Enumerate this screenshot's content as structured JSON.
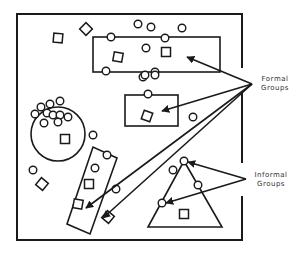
{
  "labels": {
    "formal": [
      "Formal",
      "Groups"
    ],
    "informal": [
      "Informal",
      "Groups"
    ]
  },
  "colors": {
    "stroke": "#1a1a1a",
    "background": "#ffffff",
    "label": "#333333"
  },
  "frame": {
    "x1": 17,
    "y1": 14,
    "x2": 242,
    "y2": 240,
    "right_gaps": [
      [
        68,
        92
      ],
      [
        163,
        196
      ]
    ]
  },
  "formal_groups": [
    {
      "shape": "rect",
      "x": 93,
      "y": 37,
      "w": 127,
      "h": 35
    },
    {
      "shape": "rect",
      "x": 125,
      "y": 95,
      "w": 53,
      "h": 31
    },
    {
      "shape": "rotated-rect",
      "points": [
        [
          67,
          224
        ],
        [
          93,
          147
        ],
        [
          117,
          158
        ],
        [
          90,
          234
        ]
      ]
    }
  ],
  "informal_groups": [
    {
      "shape": "circle",
      "cx": 58,
      "cy": 134,
      "r": 27
    },
    {
      "shape": "triangle",
      "points": [
        [
          184,
          161
        ],
        [
          148,
          227
        ],
        [
          222,
          227
        ]
      ]
    }
  ],
  "people_circles": [
    [
      138,
      24
    ],
    [
      151,
      27
    ],
    [
      182,
      28
    ],
    [
      111,
      37
    ],
    [
      165,
      38
    ],
    [
      146,
      48
    ],
    [
      106,
      71
    ],
    [
      143,
      77
    ],
    [
      155,
      72
    ],
    [
      155,
      75
    ],
    [
      145,
      75
    ],
    [
      148,
      94
    ],
    [
      60,
      101
    ],
    [
      50,
      104
    ],
    [
      41,
      107
    ],
    [
      35,
      114
    ],
    [
      47,
      113
    ],
    [
      53,
      115
    ],
    [
      60,
      115
    ],
    [
      68,
      117
    ],
    [
      44,
      123
    ],
    [
      58,
      122
    ],
    [
      93,
      135
    ],
    [
      107,
      155
    ],
    [
      95,
      168
    ],
    [
      33,
      170
    ],
    [
      116,
      189
    ],
    [
      193,
      117
    ],
    [
      184,
      161
    ],
    [
      173,
      170
    ],
    [
      198,
      185
    ],
    [
      162,
      203
    ]
  ],
  "people_squares": [
    {
      "cx": 58,
      "cy": 38,
      "rot": 5
    },
    {
      "cx": 86,
      "cy": 29,
      "rot": 45
    },
    {
      "cx": 118,
      "cy": 57,
      "rot": 10
    },
    {
      "cx": 166,
      "cy": 52,
      "rot": 0
    },
    {
      "cx": 147,
      "cy": 116,
      "rot": 20
    },
    {
      "cx": 65,
      "cy": 139,
      "rot": 0
    },
    {
      "cx": 42,
      "cy": 184,
      "rot": 40
    },
    {
      "cx": 89,
      "cy": 184,
      "rot": 0
    },
    {
      "cx": 78,
      "cy": 204,
      "rot": 10
    },
    {
      "cx": 108,
      "cy": 217,
      "rot": 40
    },
    {
      "cx": 184,
      "cy": 214,
      "rot": 0
    }
  ],
  "formal_arrows": {
    "origin": [
      252,
      84
    ],
    "targets": [
      [
        187,
        57
      ],
      [
        162,
        111
      ],
      [
        86,
        208
      ],
      [
        103,
        218
      ]
    ]
  },
  "informal_arrows": {
    "origin": [
      246,
      179
    ],
    "targets": [
      [
        188,
        162
      ],
      [
        166,
        203
      ]
    ]
  }
}
